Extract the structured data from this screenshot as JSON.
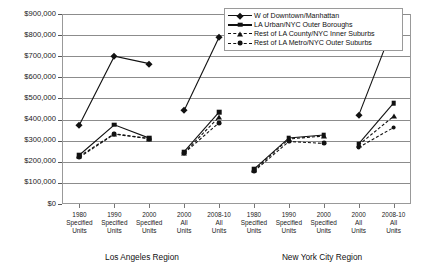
{
  "chart_data": {
    "type": "line",
    "title": "",
    "xlabel": "",
    "ylabel": "",
    "ylim": [
      0,
      900000
    ],
    "ytick_labels": [
      "$900,000",
      "$800,000",
      "$700,000",
      "$600,000",
      "$500,000",
      "$400,000",
      "$300,000",
      "$200,000",
      "$100,000",
      "$0"
    ],
    "ytick_values": [
      900000,
      800000,
      700000,
      600000,
      500000,
      400000,
      300000,
      200000,
      100000,
      0
    ],
    "grid": true,
    "legend_position": "top-right",
    "categories": [
      "1980 Specified Units",
      "1990 Specified Units",
      "2000 Specified Units",
      "2000 All Units",
      "2008-10 All Units",
      "1980 Specified Units",
      "1990 Specified Units",
      "2000 Specified Units",
      "2000 All Units",
      "2008-10 All Units"
    ],
    "category_lines": [
      [
        "1980",
        "Specified",
        "Units"
      ],
      [
        "1990",
        "Specified",
        "Units"
      ],
      [
        "2000",
        "Specified",
        "Units"
      ],
      [
        "2000",
        "All",
        "Units"
      ],
      [
        "2008-10",
        "All",
        "Units"
      ],
      [
        "1980",
        "Specified",
        "Units"
      ],
      [
        "1990",
        "Specified",
        "Units"
      ],
      [
        "2000",
        "Specified",
        "Units"
      ],
      [
        "2000",
        "All",
        "Units"
      ],
      [
        "2008-10",
        "All",
        "Units"
      ]
    ],
    "group_labels": [
      "Los Angeles Region",
      "New York City Region"
    ],
    "segments": [
      [
        0,
        1,
        2
      ],
      [
        3,
        4
      ],
      [
        5,
        6,
        7
      ],
      [
        8,
        9
      ]
    ],
    "series": [
      {
        "name": "W of Downtown/Manhattan",
        "marker": "diamond",
        "values": [
          375000,
          700000,
          665000,
          443000,
          790000,
          null,
          null,
          null,
          420000,
          845000
        ]
      },
      {
        "name": "LA Urban/NYC Outer Boroughs",
        "marker": "square",
        "values": [
          232000,
          375000,
          312000,
          248000,
          435000,
          165000,
          313000,
          327000,
          285000,
          478000
        ]
      },
      {
        "name": "Rest of LA County/NYC Inner Suburbs",
        "marker": "triangle",
        "values": [
          226000,
          333000,
          310000,
          243000,
          412000,
          160000,
          308000,
          322000,
          280000,
          415000
        ]
      },
      {
        "name": "Rest of LA Metro/NYC Outer Suburbs",
        "marker": "circle",
        "values": [
          221000,
          331000,
          309000,
          241000,
          385000,
          155000,
          296000,
          287000,
          268000,
          362000
        ]
      }
    ]
  }
}
